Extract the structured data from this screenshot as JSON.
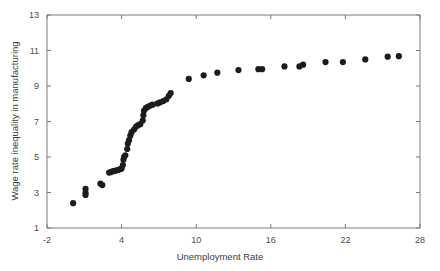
{
  "chart_data": {
    "type": "scatter",
    "title": "",
    "xlabel": "Unemployment Rate",
    "ylabel": "Wage rate inequality in manufacturing",
    "xlim": [
      -2,
      28
    ],
    "ylim": [
      1,
      13
    ],
    "xticks": [
      -2,
      4,
      10,
      16,
      22,
      28
    ],
    "yticks": [
      1,
      3,
      5,
      7,
      9,
      11,
      13
    ],
    "xtick_labels": [
      "-2",
      "4",
      "10",
      "16",
      "22",
      "28"
    ],
    "ytick_labels": [
      "1",
      "3",
      "5",
      "7",
      "9",
      "11",
      "13"
    ],
    "grid": false,
    "legend": null,
    "marker": "circle",
    "marker_color": "#1c1c1c",
    "marker_size": 3.1,
    "points": [
      [
        0.1,
        2.4
      ],
      [
        1.1,
        3.2
      ],
      [
        1.1,
        2.98
      ],
      [
        1.1,
        2.86
      ],
      [
        2.3,
        3.5
      ],
      [
        2.45,
        3.42
      ],
      [
        3.0,
        4.12
      ],
      [
        3.15,
        4.15
      ],
      [
        3.3,
        4.2
      ],
      [
        3.45,
        4.22
      ],
      [
        3.6,
        4.25
      ],
      [
        3.75,
        4.28
      ],
      [
        3.9,
        4.32
      ],
      [
        4.0,
        4.35
      ],
      [
        4.1,
        4.55
      ],
      [
        4.15,
        4.85
      ],
      [
        4.2,
        5.0
      ],
      [
        4.3,
        5.1
      ],
      [
        4.45,
        5.45
      ],
      [
        4.5,
        5.75
      ],
      [
        4.6,
        5.95
      ],
      [
        4.7,
        6.2
      ],
      [
        4.8,
        6.4
      ],
      [
        5.0,
        6.55
      ],
      [
        5.15,
        6.7
      ],
      [
        5.3,
        6.78
      ],
      [
        5.5,
        6.85
      ],
      [
        5.7,
        7.05
      ],
      [
        5.75,
        7.35
      ],
      [
        5.8,
        7.6
      ],
      [
        5.95,
        7.75
      ],
      [
        6.1,
        7.82
      ],
      [
        6.3,
        7.9
      ],
      [
        6.5,
        7.95
      ],
      [
        6.9,
        8.02
      ],
      [
        7.1,
        8.08
      ],
      [
        7.35,
        8.15
      ],
      [
        7.6,
        8.25
      ],
      [
        7.8,
        8.45
      ],
      [
        7.95,
        8.6
      ],
      [
        9.4,
        9.4
      ],
      [
        10.6,
        9.6
      ],
      [
        11.7,
        9.75
      ],
      [
        13.4,
        9.9
      ],
      [
        15.0,
        9.95
      ],
      [
        15.3,
        9.95
      ],
      [
        17.1,
        10.1
      ],
      [
        18.3,
        10.1
      ],
      [
        18.6,
        10.2
      ],
      [
        20.4,
        10.35
      ],
      [
        21.8,
        10.35
      ],
      [
        23.6,
        10.5
      ],
      [
        25.4,
        10.65
      ],
      [
        26.3,
        10.68
      ]
    ]
  }
}
